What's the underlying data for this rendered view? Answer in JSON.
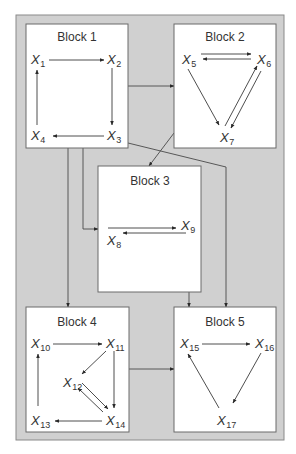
{
  "colors": {
    "frame_fill": "#d0d0d0",
    "frame_stroke": "#8a8a8a",
    "block_fill": "#ffffff",
    "line": "#3a3a3a",
    "text": "#333333"
  },
  "frame": {
    "x": 16,
    "y": 15,
    "w": 268,
    "h": 425
  },
  "blocks": [
    {
      "id": "block1",
      "label": "Block 1",
      "x": 26,
      "y": 24,
      "w": 102,
      "h": 124,
      "label_x": 77,
      "label_y": 41
    },
    {
      "id": "block2",
      "label": "Block 2",
      "x": 174,
      "y": 24,
      "w": 102,
      "h": 124,
      "label_x": 225,
      "label_y": 41
    },
    {
      "id": "block3",
      "label": "Block 3",
      "x": 98,
      "y": 166,
      "w": 103,
      "h": 126,
      "label_x": 150,
      "label_y": 185
    },
    {
      "id": "block4",
      "label": "Block 4",
      "x": 26,
      "y": 307,
      "w": 103,
      "h": 125,
      "label_x": 77,
      "label_y": 326
    },
    {
      "id": "block5",
      "label": "Block 5",
      "x": 174,
      "y": 307,
      "w": 102,
      "h": 125,
      "label_x": 225,
      "label_y": 326
    }
  ],
  "nodes": [
    {
      "id": "X1",
      "base": "X",
      "sub": "1",
      "x": 31,
      "y": 64
    },
    {
      "id": "X2",
      "base": "X",
      "sub": "2",
      "x": 107,
      "y": 64
    },
    {
      "id": "X3",
      "base": "X",
      "sub": "3",
      "x": 107,
      "y": 140
    },
    {
      "id": "X4",
      "base": "X",
      "sub": "4",
      "x": 31,
      "y": 140
    },
    {
      "id": "X5",
      "base": "X",
      "sub": "5",
      "x": 182,
      "y": 64
    },
    {
      "id": "X6",
      "base": "X",
      "sub": "6",
      "x": 257,
      "y": 64
    },
    {
      "id": "X7",
      "base": "X",
      "sub": "7",
      "x": 220,
      "y": 142
    },
    {
      "id": "X8",
      "base": "X",
      "sub": "8",
      "x": 107,
      "y": 245
    },
    {
      "id": "X9",
      "base": "X",
      "sub": "9",
      "x": 181,
      "y": 230
    },
    {
      "id": "X10",
      "base": "X",
      "sub": "10",
      "x": 31,
      "y": 348
    },
    {
      "id": "X11",
      "base": "X",
      "sub": "11",
      "x": 106,
      "y": 348
    },
    {
      "id": "X12",
      "base": "X",
      "sub": "12",
      "x": 63,
      "y": 387
    },
    {
      "id": "X13",
      "base": "X",
      "sub": "13",
      "x": 31,
      "y": 425
    },
    {
      "id": "X14",
      "base": "X",
      "sub": "14",
      "x": 106,
      "y": 425
    },
    {
      "id": "X15",
      "base": "X",
      "sub": "15",
      "x": 180,
      "y": 348
    },
    {
      "id": "X16",
      "base": "X",
      "sub": "16",
      "x": 255,
      "y": 348
    },
    {
      "id": "X17",
      "base": "X",
      "sub": "17",
      "x": 217,
      "y": 425
    }
  ],
  "edges": [
    {
      "from": "X1",
      "to": "X2",
      "pts": [
        [
          49,
          60
        ],
        [
          104,
          60
        ]
      ]
    },
    {
      "from": "X2",
      "to": "X3",
      "pts": [
        [
          112,
          68
        ],
        [
          112,
          125
        ]
      ]
    },
    {
      "from": "X3",
      "to": "X4",
      "pts": [
        [
          104,
          136
        ],
        [
          53,
          136
        ]
      ]
    },
    {
      "from": "X4",
      "to": "X1",
      "pts": [
        [
          37,
          125
        ],
        [
          37,
          70
        ]
      ]
    },
    {
      "from": "X5",
      "to": "X6",
      "pts": [
        [
          201,
          54
        ],
        [
          251,
          54
        ]
      ]
    },
    {
      "from": "X6",
      "to": "X5",
      "pts": [
        [
          251,
          59
        ],
        [
          203,
          59
        ]
      ]
    },
    {
      "from": "X5",
      "to": "X7",
      "pts": [
        [
          188,
          69
        ],
        [
          219,
          125
        ]
      ]
    },
    {
      "from": "X7",
      "to": "X6",
      "pts": [
        [
          225,
          126
        ],
        [
          257,
          66
        ]
      ]
    },
    {
      "from": "X6",
      "to": "X7",
      "pts": [
        [
          261,
          71
        ],
        [
          231,
          128
        ]
      ]
    },
    {
      "from": "X8",
      "to": "X9",
      "pts": [
        [
          108,
          228
        ],
        [
          176,
          228
        ]
      ]
    },
    {
      "from": "X9",
      "to": "X8",
      "pts": [
        [
          186,
          233
        ],
        [
          123,
          233
        ]
      ]
    },
    {
      "from": "X10",
      "to": "X11",
      "pts": [
        [
          53,
          344
        ],
        [
          102,
          344
        ]
      ]
    },
    {
      "from": "X11",
      "to": "X12",
      "pts": [
        [
          106,
          351
        ],
        [
          82,
          374
        ]
      ]
    },
    {
      "from": "X11",
      "to": "X14",
      "pts": [
        [
          114,
          351
        ],
        [
          114,
          408
        ]
      ]
    },
    {
      "from": "X12",
      "to": "X14",
      "pts": [
        [
          82,
          383
        ],
        [
          108,
          409
        ]
      ]
    },
    {
      "from": "X14",
      "to": "X12",
      "pts": [
        [
          103,
          412
        ],
        [
          78,
          388
        ]
      ]
    },
    {
      "from": "X14",
      "to": "X13",
      "pts": [
        [
          102,
          421
        ],
        [
          55,
          421
        ]
      ]
    },
    {
      "from": "X13",
      "to": "X10",
      "pts": [
        [
          38,
          406
        ],
        [
          38,
          354
        ]
      ]
    },
    {
      "from": "X15",
      "to": "X16",
      "pts": [
        [
          202,
          344
        ],
        [
          250,
          344
        ]
      ]
    },
    {
      "from": "X16",
      "to": "X17",
      "pts": [
        [
          261,
          353
        ],
        [
          233,
          403
        ]
      ]
    },
    {
      "from": "X17",
      "to": "X15",
      "pts": [
        [
          219,
          408
        ],
        [
          188,
          354
        ]
      ]
    }
  ],
  "connections": [
    {
      "from": "block1",
      "to": "block2",
      "pts": [
        [
          128,
          86
        ],
        [
          174,
          86
        ]
      ]
    },
    {
      "from": "block1",
      "to": "block4",
      "pts": [
        [
          68,
          148
        ],
        [
          68,
          307
        ]
      ]
    },
    {
      "from": "block1",
      "to": "block3",
      "pts": [
        [
          83,
          148
        ],
        [
          83,
          229
        ],
        [
          98,
          229
        ]
      ]
    },
    {
      "from": "block1",
      "to": "block5",
      "pts": [
        [
          128,
          143
        ],
        [
          226,
          167
        ],
        [
          226,
          307
        ]
      ]
    },
    {
      "from": "block2",
      "to": "block3",
      "pts": [
        [
          174,
          133
        ],
        [
          149,
          166
        ]
      ]
    },
    {
      "from": "block3",
      "to": "block5",
      "pts": [
        [
          189,
          292
        ],
        [
          189,
          307
        ]
      ]
    },
    {
      "from": "block4",
      "to": "block5",
      "pts": [
        [
          129,
          369
        ],
        [
          174,
          369
        ]
      ]
    }
  ]
}
